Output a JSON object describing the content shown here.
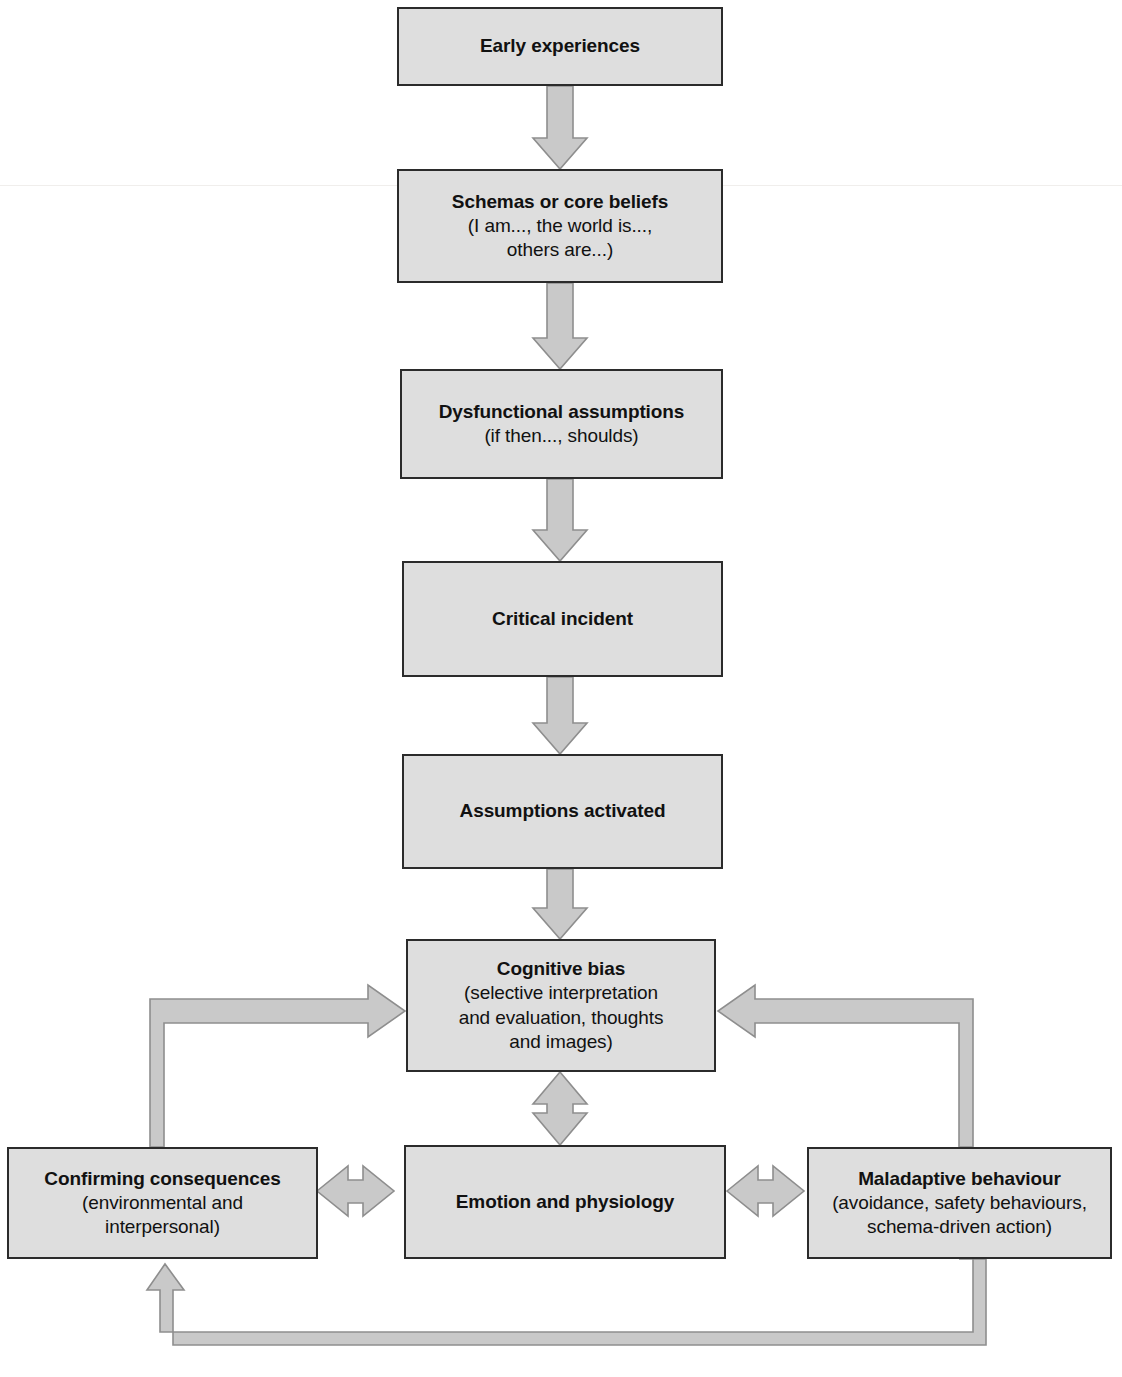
{
  "diagram": {
    "box_fill": "#dedede",
    "box_border": "#2b2b2b",
    "arrow_fill": "#c9c9c9",
    "arrow_stroke": "#8e8e8e",
    "nodes": [
      {
        "id": "early-experiences",
        "title": "Early experiences",
        "sub": ""
      },
      {
        "id": "schemas-or-core-beliefs",
        "title": "Schemas or core beliefs",
        "sub": "(I am..., the world is...,\nothers are...)"
      },
      {
        "id": "dysfunctional-assumptions",
        "title": "Dysfunctional assumptions",
        "sub": "(if then..., shoulds)"
      },
      {
        "id": "critical-incident",
        "title": "Critical incident",
        "sub": ""
      },
      {
        "id": "assumptions-activated",
        "title": "Assumptions activated",
        "sub": ""
      },
      {
        "id": "cognitive-bias",
        "title": "Cognitive bias",
        "sub": "(selective interpretation\nand evaluation, thoughts\nand images)"
      },
      {
        "id": "confirming-consequences",
        "title": "Confirming consequences",
        "sub": "(environmental and\ninterpersonal)"
      },
      {
        "id": "emotion-and-physiology",
        "title": "Emotion and physiology",
        "sub": ""
      },
      {
        "id": "maladaptive-behaviour",
        "title": "Maladaptive behaviour",
        "sub": "(avoidance, safety behaviours,\nschema-driven action)"
      }
    ],
    "connectors": [
      {
        "id": "early-to-schemas",
        "kind": "arrow-down"
      },
      {
        "id": "schemas-to-assumptions",
        "kind": "arrow-down"
      },
      {
        "id": "assumptions-to-critical-incident",
        "kind": "arrow-down"
      },
      {
        "id": "critical-incident-to-assumptions-activated",
        "kind": "arrow-down"
      },
      {
        "id": "assumptions-activated-to-cognitive-bias",
        "kind": "arrow-down"
      },
      {
        "id": "cognitive-bias-to-emotion",
        "kind": "arrow-double-vertical"
      },
      {
        "id": "confirming-to-emotion",
        "kind": "arrow-double-horizontal"
      },
      {
        "id": "emotion-to-maladaptive",
        "kind": "arrow-double-horizontal"
      },
      {
        "id": "confirming-to-cognitive-bias-loop",
        "kind": "elbow-arrow-up-right"
      },
      {
        "id": "maladaptive-to-cognitive-bias-loop",
        "kind": "elbow-arrow-up-left"
      },
      {
        "id": "maladaptive-to-confirming-loop",
        "kind": "elbow-arrow-down-left-up"
      }
    ]
  }
}
